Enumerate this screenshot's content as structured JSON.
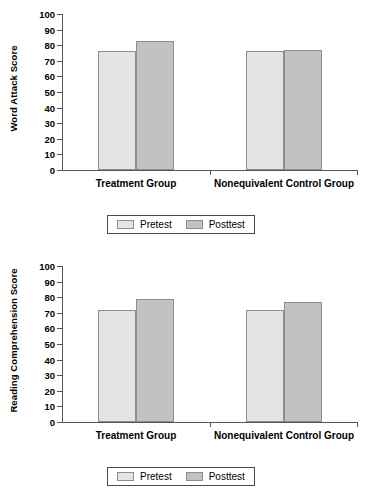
{
  "chart_data": [
    {
      "type": "bar",
      "title": "",
      "xlabel": "",
      "ylabel": "Word Attack Score",
      "ylim": [
        0,
        100
      ],
      "yticks": [
        0,
        10,
        20,
        30,
        40,
        50,
        60,
        70,
        80,
        90,
        100
      ],
      "ytick_labels": [
        "0",
        "10",
        "20",
        "30",
        "40",
        "50",
        "60",
        "70",
        "80",
        "90",
        "100"
      ],
      "grid": false,
      "legend_position": "bottom",
      "categories": [
        "Treatment Group",
        "Nonequivalent Control Group"
      ],
      "series": [
        {
          "name": "Pretest",
          "color": "#e4e4e4",
          "values": [
            76,
            76
          ]
        },
        {
          "name": "Posttest",
          "color": "#c2c2c2",
          "values": [
            83,
            77
          ]
        }
      ]
    },
    {
      "type": "bar",
      "title": "",
      "xlabel": "",
      "ylabel": "Reading Comprehension Score",
      "ylim": [
        0,
        100
      ],
      "yticks": [
        0,
        10,
        20,
        30,
        40,
        50,
        60,
        70,
        80,
        90,
        100
      ],
      "ytick_labels": [
        "0",
        "10",
        "20",
        "30",
        "40",
        "50",
        "60",
        "70",
        "80",
        "90",
        "100"
      ],
      "grid": false,
      "legend_position": "bottom",
      "categories": [
        "Treatment Group",
        "Nonequivalent Control Group"
      ],
      "series": [
        {
          "name": "Pretest",
          "color": "#e4e4e4",
          "values": [
            72,
            72
          ]
        },
        {
          "name": "Posttest",
          "color": "#c2c2c2",
          "values": [
            79,
            77
          ]
        }
      ]
    }
  ]
}
